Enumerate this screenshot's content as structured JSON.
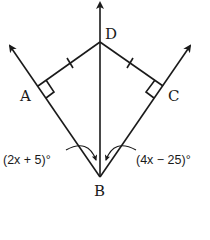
{
  "diagram": {
    "points": {
      "A": "A",
      "B": "B",
      "C": "C",
      "D": "D"
    },
    "angles": {
      "left": "(2x + 5)°",
      "right": "(4x − 25)°"
    },
    "markers": {
      "right_angle_at_A": true,
      "right_angle_at_C": true,
      "tick_marks": "DA ≅ DC"
    },
    "line_color": "#1a1a1a"
  }
}
